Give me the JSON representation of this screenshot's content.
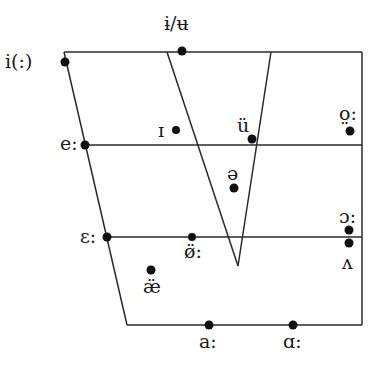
{
  "diagram": {
    "type": "vowel-quadrilateral",
    "line_color": "#2a2a2a",
    "dot_color": "#111111",
    "frame": {
      "top_left": [
        64,
        52
      ],
      "top_right": [
        362,
        52
      ],
      "bottom_right": [
        362,
        325
      ],
      "bottom_left": [
        127,
        325
      ]
    },
    "horizontal_lines": [
      {
        "y": 145,
        "x_start": 85,
        "x_end": 362
      },
      {
        "y": 237,
        "x_start": 107,
        "x_end": 362
      }
    ],
    "central_wedge": {
      "left_top": [
        167,
        52
      ],
      "right_top": [
        271,
        52
      ],
      "apex": [
        238,
        266
      ]
    },
    "vowels": [
      {
        "symbol": "i(:)",
        "dot": [
          65,
          62
        ],
        "label_pos": [
          5,
          52
        ]
      },
      {
        "symbol": "ɨ/ʉ",
        "dot": [
          182,
          51
        ],
        "label_pos": [
          164,
          14
        ]
      },
      {
        "symbol": "ɪ",
        "dot": [
          176,
          130
        ],
        "label_pos": [
          157,
          120
        ]
      },
      {
        "symbol": "ü",
        "dot": [
          252,
          139
        ],
        "label_pos": [
          237,
          115
        ]
      },
      {
        "symbol": "o̤:",
        "dot": [
          350,
          131
        ],
        "label_pos": [
          339,
          105
        ]
      },
      {
        "symbol": "e:",
        "dot": [
          85,
          145
        ],
        "label_pos": [
          60,
          135
        ]
      },
      {
        "symbol": "ə",
        "dot": [
          234,
          188
        ],
        "label_pos": [
          226,
          163
        ]
      },
      {
        "symbol": "ɔ:",
        "dot": [
          349,
          230
        ],
        "label_pos": [
          339,
          208
        ]
      },
      {
        "symbol": "ɛ:",
        "dot": [
          107,
          237
        ],
        "label_pos": [
          80,
          227
        ]
      },
      {
        "symbol": "ø̈:",
        "dot": [
          192,
          237
        ],
        "label_pos": [
          184,
          243
        ]
      },
      {
        "symbol": "",
        "dot": [
          349,
          243
        ],
        "label_pos": null
      },
      {
        "symbol": "ʌ",
        "dot": null,
        "label_pos": [
          341,
          252
        ]
      },
      {
        "symbol": "æ̈",
        "dot": [
          151,
          270
        ],
        "label_pos": [
          142,
          277
        ]
      },
      {
        "symbol": "a:",
        "dot": [
          209,
          325
        ],
        "label_pos": [
          199,
          333
        ]
      },
      {
        "symbol": "ɑ:",
        "dot": [
          293,
          325
        ],
        "label_pos": [
          283,
          333
        ]
      }
    ]
  },
  "labels": {
    "i_long": "i(:)",
    "barred_i_u": "ɨ/ʉ",
    "small_cap_i": "ɪ",
    "u_diaeresis": "ü",
    "o_long": "o̤:",
    "e_long": "e:",
    "schwa": "ə",
    "open_o_long": "ɔ:",
    "open_e_long": "ɛ:",
    "o_slash_long": "ø̈:",
    "wedge": "ʌ",
    "ash": "æ̈",
    "a_long": "a:",
    "alpha_long": "ɑ:"
  }
}
